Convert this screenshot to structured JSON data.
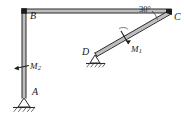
{
  "figure": {
    "type": "structural-frame-diagram",
    "background_color": "#ffffff",
    "line_color": "#2b2b2b",
    "member_fill_color": "#bdbdbd"
  },
  "labels": {
    "point_a": "A",
    "point_b": "B",
    "point_c": "C",
    "point_d": "D",
    "moment_1": "M",
    "moment_1_sub": "1",
    "moment_2": "M",
    "moment_2_sub": "2",
    "angle_c": "30°"
  },
  "geometry": {
    "column_ab": {
      "from": "A",
      "to": "B",
      "orientation": "vertical"
    },
    "beam_bc": {
      "from": "B",
      "to": "C",
      "orientation": "horizontal"
    },
    "strut_dc": {
      "from": "D",
      "to": "C",
      "orientation": "inclined",
      "angle_deg": 30
    }
  },
  "supports": {
    "a": {
      "at": "A",
      "kind": "pin-support-hatched"
    },
    "d": {
      "at": "D",
      "kind": "pin-support-hatched"
    }
  },
  "loads": {
    "m1": {
      "label": "M1",
      "applied_to": "strut_dc",
      "kind": "concentrated-moment"
    },
    "m2": {
      "label": "M2",
      "applied_to": "column_ab",
      "kind": "concentrated-moment"
    }
  }
}
